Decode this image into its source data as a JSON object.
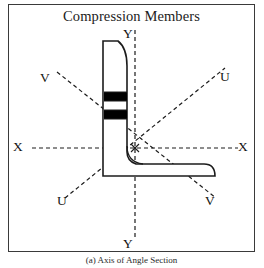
{
  "figure": {
    "title": "Compression Members",
    "caption": "(a) Axis of Angle Section",
    "frame_color": "#3a3a3a",
    "background_color": "#ffffff",
    "line_color": "#1c1c1c",
    "fill_color": "#000000"
  },
  "axes": {
    "labels": [
      {
        "id": "y-top",
        "text": "Y",
        "x": 127,
        "y": 28
      },
      {
        "id": "y-bottom",
        "text": "Y",
        "x": 127,
        "y": 238
      },
      {
        "id": "x-left",
        "text": "X",
        "x": 14,
        "y": 138
      },
      {
        "id": "x-right",
        "text": "X",
        "x": 236,
        "y": 138
      },
      {
        "id": "v-upper-left",
        "text": "V",
        "x": 40,
        "y": 70
      },
      {
        "id": "u-upper-right",
        "text": "U",
        "x": 219,
        "y": 70
      },
      {
        "id": "u-lower-left",
        "text": "U",
        "x": 56,
        "y": 192
      },
      {
        "id": "v-lower-right",
        "text": "V",
        "x": 205,
        "y": 192
      }
    ],
    "names": [
      "X-X",
      "Y-Y",
      "U-U",
      "V-V"
    ],
    "origin": {
      "x": 135,
      "y": 148,
      "marker": "centroid-marker"
    }
  },
  "section": {
    "type": "equal-angle-section",
    "vertical_leg": {
      "x_left": 103,
      "x_right": 126,
      "y_top": 41,
      "y_bottom": 175,
      "rounded_top": true
    },
    "horizontal_leg": {
      "x_left": 103,
      "x_right": 212,
      "y_top": 155,
      "y_bottom": 175,
      "rounded_right": true
    },
    "hatch_bands": [
      {
        "id": "band-upper",
        "x": 104,
        "y": 92,
        "width": 22,
        "height": 9
      },
      {
        "id": "band-lower",
        "x": 104,
        "y": 110,
        "width": 22,
        "height": 9
      }
    ]
  }
}
